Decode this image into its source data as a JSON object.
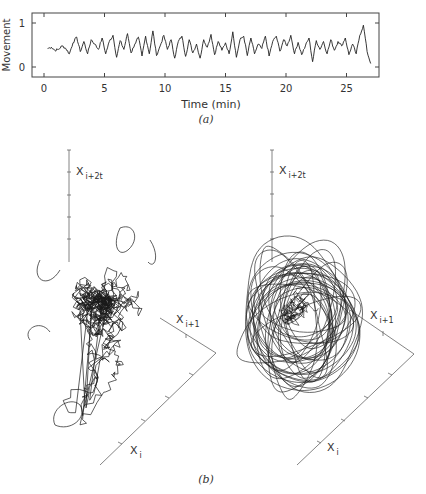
{
  "figure": {
    "panel_a": {
      "ylabel": "Movement",
      "xlabel": "Time (min)",
      "caption": "(a)",
      "yticks": [
        "0",
        "1"
      ],
      "xticks": [
        "0",
        "5",
        "10",
        "15",
        "20",
        "25"
      ]
    },
    "panel_b": {
      "caption": "(b)",
      "left_plot": {
        "axis_z": "X",
        "axis_z_sub": "i+2t",
        "axis_y": "X",
        "axis_y_sub": "i+1",
        "axis_x": "X",
        "axis_x_sub": "i"
      },
      "right_plot": {
        "axis_z": "X",
        "axis_z_sub": "i+2t",
        "axis_y": "X",
        "axis_y_sub": "i+1",
        "axis_x": "X",
        "axis_x_sub": "i"
      }
    }
  },
  "chart_data": [
    {
      "type": "line",
      "title": "",
      "xlabel": "Time (min)",
      "ylabel": "Movement",
      "xlim": [
        -2.5,
        27.5
      ],
      "ylim": [
        -0.25,
        1.1
      ],
      "xticks": [
        0,
        5,
        10,
        15,
        20,
        25
      ],
      "yticks": [
        0,
        1
      ],
      "grid": false,
      "x": [
        0.3,
        0.6,
        0.9,
        1.2,
        1.5,
        1.8,
        2.1,
        2.4,
        2.7,
        3.0,
        3.3,
        3.6,
        3.9,
        4.2,
        4.5,
        4.8,
        5.1,
        5.4,
        5.7,
        6.0,
        6.3,
        6.6,
        6.9,
        7.2,
        7.5,
        7.8,
        8.1,
        8.4,
        8.7,
        9.0,
        9.3,
        9.6,
        9.9,
        10.2,
        10.5,
        10.8,
        11.1,
        11.4,
        11.7,
        12.0,
        12.3,
        12.6,
        12.9,
        13.2,
        13.5,
        13.8,
        14.1,
        14.4,
        14.7,
        15.0,
        15.3,
        15.6,
        15.9,
        16.2,
        16.5,
        16.8,
        17.1,
        17.4,
        17.7,
        18.0,
        18.3,
        18.6,
        18.9,
        19.2,
        19.5,
        19.8,
        20.1,
        20.4,
        20.7,
        21.0,
        21.3,
        21.6,
        21.9,
        22.2,
        22.5,
        22.8,
        23.1,
        23.4,
        23.7,
        24.0,
        24.3,
        24.6,
        24.9,
        25.2,
        25.5,
        25.8,
        26.1,
        26.4,
        26.7,
        27.0
      ],
      "series": [
        {
          "name": "Movement",
          "values": [
            0.42,
            0.45,
            0.38,
            0.4,
            0.48,
            0.42,
            0.3,
            0.55,
            0.68,
            0.35,
            0.58,
            0.3,
            0.62,
            0.52,
            0.4,
            0.66,
            0.3,
            0.58,
            0.72,
            0.22,
            0.6,
            0.4,
            0.76,
            0.32,
            0.52,
            0.68,
            0.25,
            0.7,
            0.3,
            0.82,
            0.26,
            0.48,
            0.72,
            0.4,
            0.62,
            0.2,
            0.58,
            0.7,
            0.24,
            0.62,
            0.32,
            0.52,
            0.2,
            0.62,
            0.45,
            0.74,
            0.28,
            0.58,
            0.38,
            0.55,
            0.3,
            0.8,
            0.22,
            0.62,
            0.7,
            0.26,
            0.66,
            0.3,
            0.52,
            0.42,
            0.7,
            0.25,
            0.58,
            0.7,
            0.36,
            0.62,
            0.48,
            0.72,
            0.3,
            0.56,
            0.28,
            0.48,
            0.66,
            0.12,
            0.6,
            0.4,
            0.58,
            0.3,
            0.62,
            0.38,
            0.58,
            0.48,
            0.66,
            0.28,
            0.52,
            0.3,
            0.72,
            0.95,
            0.35,
            0.08
          ]
        }
      ]
    },
    {
      "type": "line",
      "subtype": "3d-phase-portrait",
      "title": "(b) left",
      "axes": [
        "X_i",
        "X_i+1",
        "X_i+2t"
      ],
      "description": "Dense, irregular (noise-like) trajectory cluster with a tail extending downward-left"
    },
    {
      "type": "line",
      "subtype": "3d-phase-portrait",
      "title": "(b) right",
      "axes": [
        "X_i",
        "X_i+1",
        "X_i+2t"
      ],
      "description": "Smoother looping orbits forming a rounded attractor-like cluster"
    }
  ]
}
